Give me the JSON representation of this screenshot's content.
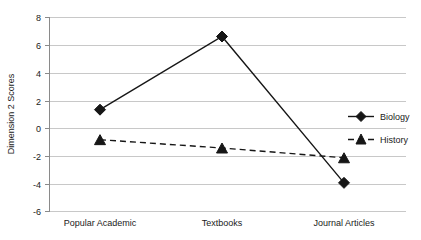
{
  "chart_data": {
    "type": "line",
    "title": "",
    "xlabel": "",
    "ylabel": "Dimension 2 Scores",
    "categories": [
      "Popular Academic",
      "Textbooks",
      "Journal Articles"
    ],
    "ylim": [
      -6,
      8
    ],
    "yticks": [
      -6,
      -4,
      -2,
      0,
      2,
      4,
      6,
      8
    ],
    "ytick_labels": [
      "-6",
      "-4",
      "-2",
      "0",
      "2",
      "4",
      "6",
      "8"
    ],
    "grid": true,
    "legend_position": "center right (inside plot)",
    "series": [
      {
        "name": "Biology",
        "values": [
          1.35,
          6.6,
          -3.9
        ],
        "line_style": "solid",
        "marker": "diamond",
        "color": "#161616"
      },
      {
        "name": "History",
        "values": [
          -0.8,
          -1.4,
          -2.1
        ],
        "line_style": "dashed",
        "marker": "triangle",
        "color": "#161616"
      }
    ]
  },
  "axes": {
    "y_title": "Dimension 2 Scores",
    "y_tick_0": "8",
    "y_tick_1": "6",
    "y_tick_2": "4",
    "y_tick_3": "2",
    "y_tick_4": "0",
    "y_tick_5": "-2",
    "y_tick_6": "-4",
    "y_tick_7": "-6",
    "x_cat_0": "Popular Academic",
    "x_cat_1": "Textbooks",
    "x_cat_2": "Journal Articles"
  },
  "legend": {
    "item_0": "Biology",
    "item_1": "History"
  }
}
